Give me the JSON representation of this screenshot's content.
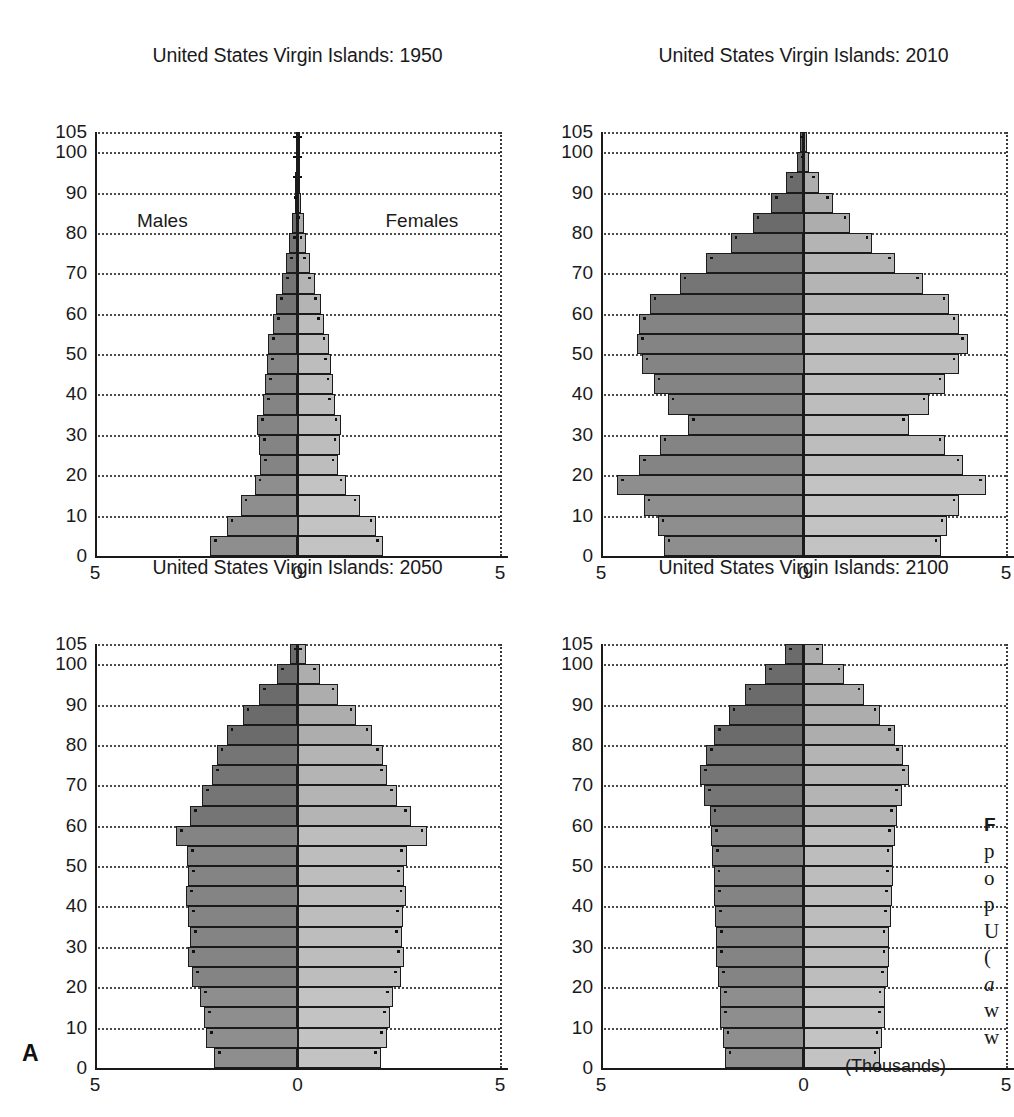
{
  "figure": {
    "panel_letter": "A",
    "units_label": "(Thousands)",
    "series_labels": {
      "male": "Males",
      "female": "Females"
    },
    "y_ticks": [
      "105",
      "100",
      "90",
      "80",
      "70",
      "60",
      "50",
      "40",
      "30",
      "20",
      "10",
      "0"
    ],
    "x_ticks": [
      "5",
      "0",
      "5"
    ],
    "colors": {
      "male_bar": "#8e8e8e",
      "female_bar": "#c3c3c3",
      "bar_outline": "#1b1b1b",
      "axis": "#1a1a1a",
      "gridline": "#4a4a4a",
      "background": "#ffffff"
    }
  },
  "caption": {
    "lines": [
      "F",
      "p",
      "o",
      "p",
      "U",
      "(",
      "a",
      "w",
      "w"
    ]
  },
  "chart_data": [
    {
      "type": "bar",
      "subtype": "population-pyramid",
      "title": "United States Virgin Islands: 1950",
      "xlabel": "(Thousands)",
      "ylabel": "",
      "xlim": [
        -5,
        5
      ],
      "ylim": [
        0,
        105
      ],
      "grid": true,
      "legend": [
        "Males",
        "Females"
      ],
      "categories": [
        "0-4",
        "5-9",
        "10-14",
        "15-19",
        "20-24",
        "25-29",
        "30-34",
        "35-39",
        "40-44",
        "45-49",
        "50-54",
        "55-59",
        "60-64",
        "65-69",
        "70-74",
        "75-79",
        "80-84",
        "85-89",
        "90-94",
        "95-99",
        "100-105"
      ],
      "series": [
        {
          "name": "Males",
          "values": [
            2.15,
            1.75,
            1.4,
            1.05,
            0.92,
            0.95,
            1.0,
            0.85,
            0.8,
            0.75,
            0.72,
            0.6,
            0.52,
            0.38,
            0.28,
            0.2,
            0.13,
            0.07,
            0.05,
            0.04,
            0.04
          ]
        },
        {
          "name": "Females",
          "values": [
            2.1,
            1.95,
            1.55,
            1.2,
            1.0,
            1.05,
            1.08,
            0.92,
            0.88,
            0.82,
            0.78,
            0.65,
            0.58,
            0.42,
            0.3,
            0.22,
            0.15,
            0.08,
            0.05,
            0.04,
            0.04
          ]
        }
      ]
    },
    {
      "type": "bar",
      "subtype": "population-pyramid",
      "title": "United States Virgin Islands: 2010",
      "xlabel": "(Thousands)",
      "ylabel": "",
      "xlim": [
        -5,
        5
      ],
      "ylim": [
        0,
        105
      ],
      "grid": true,
      "legend": [
        "Males",
        "Females"
      ],
      "categories": [
        "0-4",
        "5-9",
        "10-14",
        "15-19",
        "20-24",
        "25-29",
        "30-34",
        "35-39",
        "40-44",
        "45-49",
        "50-54",
        "55-59",
        "60-64",
        "65-69",
        "70-74",
        "75-79",
        "80-84",
        "85-89",
        "90-94",
        "95-99",
        "100-105"
      ],
      "series": [
        {
          "name": "Males",
          "values": [
            3.45,
            3.6,
            3.95,
            4.6,
            4.05,
            3.55,
            2.85,
            3.35,
            3.7,
            4.0,
            4.1,
            4.05,
            3.8,
            3.05,
            2.4,
            1.8,
            1.25,
            0.8,
            0.42,
            0.15,
            0.08
          ]
        },
        {
          "name": "Females",
          "values": [
            3.4,
            3.55,
            3.85,
            4.5,
            3.95,
            3.5,
            2.6,
            3.1,
            3.5,
            3.85,
            4.05,
            3.85,
            3.6,
            2.95,
            2.25,
            1.7,
            1.15,
            0.72,
            0.38,
            0.14,
            0.08
          ]
        }
      ]
    },
    {
      "type": "bar",
      "subtype": "population-pyramid",
      "title": "United States Virgin Islands: 2050",
      "xlabel": "(Thousands)",
      "ylabel": "",
      "xlim": [
        -5,
        5
      ],
      "ylim": [
        0,
        105
      ],
      "grid": true,
      "legend": [
        "Males",
        "Females"
      ],
      "categories": [
        "0-4",
        "5-9",
        "10-14",
        "15-19",
        "20-24",
        "25-29",
        "30-34",
        "35-39",
        "40-44",
        "45-49",
        "50-54",
        "55-59",
        "60-64",
        "65-69",
        "70-74",
        "75-79",
        "80-84",
        "85-89",
        "90-94",
        "95-99",
        "100-105"
      ],
      "series": [
        {
          "name": "Males",
          "values": [
            2.05,
            2.25,
            2.3,
            2.4,
            2.6,
            2.7,
            2.65,
            2.7,
            2.75,
            2.7,
            2.72,
            3.0,
            2.65,
            2.35,
            2.1,
            2.0,
            1.75,
            1.35,
            0.95,
            0.5,
            0.18
          ]
        },
        {
          "name": "Females",
          "values": [
            2.05,
            2.2,
            2.28,
            2.35,
            2.55,
            2.62,
            2.58,
            2.6,
            2.68,
            2.62,
            2.7,
            3.2,
            2.8,
            2.45,
            2.2,
            2.1,
            1.85,
            1.45,
            1.0,
            0.55,
            0.2
          ]
        }
      ]
    },
    {
      "type": "bar",
      "subtype": "population-pyramid",
      "title": "United States Virgin Islands: 2100",
      "xlabel": "(Thousands)",
      "ylabel": "",
      "xlim": [
        -5,
        5
      ],
      "ylim": [
        0,
        105
      ],
      "grid": true,
      "legend": [
        "Males",
        "Females"
      ],
      "categories": [
        "0-4",
        "5-9",
        "10-14",
        "15-19",
        "20-24",
        "25-29",
        "30-34",
        "35-39",
        "40-44",
        "45-49",
        "50-54",
        "55-59",
        "60-64",
        "65-69",
        "70-74",
        "75-79",
        "80-84",
        "85-89",
        "90-94",
        "95-99",
        "100-105"
      ],
      "series": [
        {
          "name": "Males",
          "values": [
            1.95,
            2.0,
            2.05,
            2.05,
            2.1,
            2.15,
            2.15,
            2.18,
            2.2,
            2.22,
            2.25,
            2.28,
            2.32,
            2.45,
            2.55,
            2.4,
            2.2,
            1.85,
            1.45,
            0.95,
            0.45
          ]
        },
        {
          "name": "Females",
          "values": [
            1.9,
            1.95,
            2.0,
            2.02,
            2.08,
            2.12,
            2.12,
            2.15,
            2.18,
            2.2,
            2.22,
            2.25,
            2.3,
            2.42,
            2.6,
            2.45,
            2.25,
            1.9,
            1.5,
            1.0,
            0.48
          ]
        }
      ]
    }
  ]
}
